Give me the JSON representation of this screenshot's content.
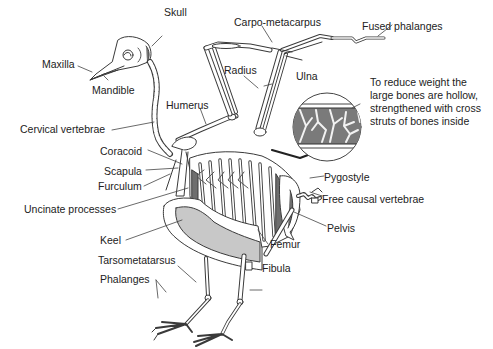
{
  "diagram": {
    "title": "",
    "labels": {
      "skull": "Skull",
      "maxilla": "Maxilla",
      "mandible": "Mandible",
      "carpo_metacarpus": "Carpo-metacarpus",
      "fused_phalanges": "Fused phalanges",
      "radius": "Radius",
      "ulna": "Ulna",
      "humerus": "Humerus",
      "cervical_vertebrae": "Cervical vertebrae",
      "coracoid": "Coracoid",
      "scapula": "Scapula",
      "furculum": "Furculum",
      "uncinate_processes": "Uncinate processes",
      "keel": "Keel",
      "tarsometatarsus": "Tarsometatarsus",
      "phalanges": "Phalanges",
      "pygostyle": "Pygostyle",
      "free_causal_vertebrae": "Free causal vertebrae",
      "pelvis": "Pelvis",
      "femur": "Femur",
      "fibula": "Fibula"
    },
    "inset_note": {
      "lines": [
        "To reduce weight the",
        "large bones are hollow,",
        "strengthened with cross",
        "struts of bones inside"
      ]
    },
    "colors": {
      "line": "#3a3a3a",
      "bone_fill": "#ffffff",
      "keel_fill": "#c8c8c8",
      "dark_fill": "#6e6e6e",
      "inset_fill": "#7a7a7a"
    }
  }
}
